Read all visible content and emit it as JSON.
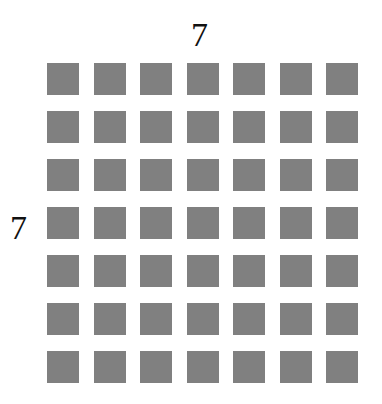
{
  "diagram": {
    "columns_label": "7",
    "rows_label": "7",
    "rows": 7,
    "columns": 7,
    "square_color": "#808080"
  }
}
